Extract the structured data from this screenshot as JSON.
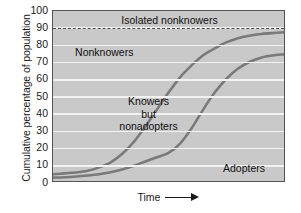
{
  "chart_data": {
    "type": "area",
    "title": "",
    "xlabel": "Time",
    "ylabel": "Cumulative percentage of population",
    "xlim": [
      0,
      100
    ],
    "ylim": [
      0,
      100
    ],
    "grid": true,
    "legend_position": "none",
    "yticks": [
      100,
      90,
      80,
      70,
      60,
      50,
      40,
      30,
      20,
      10,
      0
    ],
    "xticks": [],
    "annotations": [
      {
        "text": "Isolated nonknowers",
        "x": 50,
        "y": 95
      },
      {
        "text": "Nonknowers",
        "x": 22,
        "y": 76
      },
      {
        "text": "Knowers but nonadopters",
        "x": 41,
        "y": 40
      },
      {
        "text": "Adopters",
        "x": 82,
        "y": 9
      }
    ],
    "reference_lines": [
      {
        "label": "Isolated nonknowers threshold",
        "y": 90,
        "style": "dashed",
        "color": "#4a4a4a"
      }
    ],
    "series": [
      {
        "name": "Knowers (cumulative awareness)",
        "style": "line",
        "color": "#7a7a7a",
        "x": [
          0,
          5,
          10,
          15,
          20,
          25,
          30,
          35,
          40,
          45,
          50,
          55,
          60,
          65,
          70,
          75,
          80,
          85,
          90,
          95,
          100
        ],
        "values": [
          4,
          4.5,
          5,
          6,
          8,
          11,
          16,
          23,
          32,
          42,
          52,
          61,
          68,
          74,
          78,
          81.5,
          84,
          85.5,
          86.5,
          87,
          87.5
        ]
      },
      {
        "name": "Adopters (cumulative adoption)",
        "style": "line",
        "color": "#7a7a7a",
        "x": [
          0,
          5,
          10,
          15,
          20,
          25,
          30,
          35,
          40,
          45,
          50,
          55,
          60,
          65,
          70,
          75,
          80,
          85,
          90,
          95,
          100
        ],
        "values": [
          2,
          2.2,
          2.6,
          3.2,
          4,
          5.2,
          6.8,
          9,
          11.5,
          14,
          16.5,
          22,
          31,
          42,
          52,
          60,
          66,
          70,
          72.5,
          73.8,
          74.5
        ]
      }
    ]
  },
  "colors": {
    "plot_background": "#c9c9c9",
    "gridline": "#f2f2f2",
    "curve": "#7a7a7a",
    "axis_border": "#555555",
    "text": "#1a1a1a",
    "page_background": "#ffffff"
  }
}
